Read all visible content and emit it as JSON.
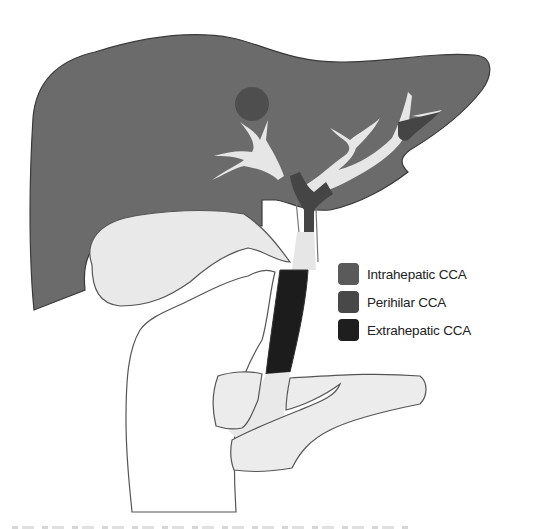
{
  "figure": {
    "colors": {
      "liver": "#6b6b6b",
      "liver_outline": "#3a3a3a",
      "bile_duct_light": "#e6e6e6",
      "gallbladder": "#e9e9e9",
      "organ_outline": "#555555",
      "intrahepatic": "#575757",
      "perihilar": "#454545",
      "extrahepatic": "#1c1c1c",
      "background": "#ffffff"
    }
  },
  "legend": {
    "items": [
      {
        "label": "Intrahepatic CCA",
        "color": "#5a5a5a"
      },
      {
        "label": "Perihilar CCA",
        "color": "#484848"
      },
      {
        "label": "Extrahepatic CCA",
        "color": "#1e1e1e"
      }
    ]
  }
}
